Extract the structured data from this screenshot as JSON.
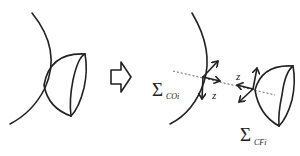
{
  "diagram": {
    "type": "coordinate-frame-transformation",
    "left_panel": {
      "elements": [
        "surface-arc",
        "hemisphere"
      ]
    },
    "transition_arrow": {
      "icon": "hollow-right-arrow-icon"
    },
    "right_panel": {
      "frames": [
        {
          "symbol": "Σ",
          "subscript": "COi",
          "axis_label": "z"
        },
        {
          "symbol": "Σ",
          "subscript": "CFi",
          "axis_label": "z"
        }
      ]
    }
  },
  "labels": {
    "frame_left_symbol": "Σ",
    "frame_left_sub": "COi",
    "frame_left_axis": "z",
    "frame_right_symbol": "Σ",
    "frame_right_sub": "CFi",
    "frame_right_axis": "z"
  },
  "colors": {
    "stroke": "#222222",
    "dashed_axis": "#555555",
    "background": "#ffffff"
  }
}
